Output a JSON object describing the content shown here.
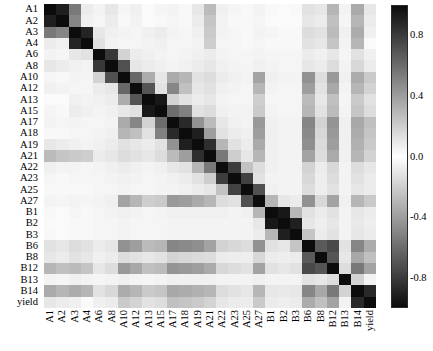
{
  "figure": {
    "type": "correlation-heatmap",
    "background": "#ffffff"
  },
  "colorbar": {
    "name": "correlation-colorbar",
    "orientation": "vertical",
    "vmin": -1.0,
    "vmax": 1.0,
    "colormap": "symmetric-gray (white at 0, black at |1|)",
    "ticks": [
      {
        "label": "0.8",
        "value": 0.8
      },
      {
        "label": "0.4",
        "value": 0.4
      },
      {
        "label": "0.0",
        "value": 0.0
      },
      {
        "label": "-0.4",
        "value": -0.4
      },
      {
        "label": "-0.8",
        "value": -0.8
      }
    ]
  },
  "chart_data": {
    "type": "heatmap",
    "title": "",
    "xlabel": "",
    "ylabel": "",
    "grid": false,
    "legend_position": "right",
    "colorbar_label": "",
    "vmin": -1.0,
    "vmax": 1.0,
    "categories": [
      "A1",
      "A2",
      "A3",
      "A4",
      "A6",
      "A8",
      "A10",
      "A12",
      "A13",
      "A15",
      "A17",
      "A18",
      "A19",
      "A21",
      "A22",
      "A23",
      "A25",
      "A27",
      "B1",
      "B2",
      "B3",
      "B6",
      "B8",
      "B12",
      "B13",
      "B14",
      "yield"
    ],
    "x_tick_labels": [
      "A1",
      "A2",
      "A3",
      "A4",
      "A6",
      "A8",
      "A10",
      "A12",
      "A13",
      "A15",
      "A17",
      "A18",
      "A19",
      "A21",
      "A22",
      "A23",
      "A25",
      "A27",
      "B1",
      "B2",
      "B3",
      "B6",
      "B8",
      "B12",
      "B13",
      "B14",
      "yield"
    ],
    "y_tick_labels": [
      "A1",
      "A2",
      "A3",
      "A4",
      "A6",
      "A8",
      "A10",
      "A12",
      "A13",
      "A15",
      "A17",
      "A18",
      "A19",
      "A21",
      "A22",
      "A23",
      "A25",
      "A27",
      "B1",
      "B2",
      "B3",
      "B6",
      "B8",
      "B12",
      "B13",
      "B14",
      "yield"
    ],
    "values": [
      [
        1.0,
        0.92,
        0.55,
        0.08,
        0.05,
        0.1,
        0.04,
        0.06,
        0.02,
        0.04,
        0.05,
        0.03,
        0.1,
        0.28,
        0.06,
        0.04,
        0.03,
        0.05,
        0.03,
        0.02,
        0.03,
        0.12,
        0.1,
        0.3,
        0.05,
        0.35,
        0.1
      ],
      [
        0.92,
        1.0,
        0.5,
        0.06,
        0.04,
        0.08,
        0.03,
        0.05,
        0.02,
        0.03,
        0.04,
        0.03,
        0.08,
        0.24,
        0.05,
        0.03,
        0.03,
        0.04,
        0.02,
        0.02,
        0.02,
        0.1,
        0.08,
        0.26,
        0.04,
        0.3,
        0.08
      ],
      [
        0.55,
        0.5,
        1.0,
        0.9,
        0.1,
        0.06,
        0.05,
        0.04,
        0.06,
        0.08,
        0.05,
        0.04,
        0.06,
        0.22,
        0.05,
        0.04,
        0.03,
        0.05,
        0.04,
        0.03,
        0.03,
        0.14,
        0.12,
        0.28,
        0.06,
        0.34,
        0.06
      ],
      [
        0.08,
        0.06,
        0.9,
        1.0,
        0.12,
        0.05,
        0.04,
        0.04,
        0.05,
        0.06,
        0.04,
        0.04,
        0.05,
        0.2,
        0.04,
        0.04,
        0.03,
        0.04,
        0.03,
        0.03,
        0.03,
        0.12,
        0.1,
        0.24,
        0.05,
        0.3,
        0.02
      ],
      [
        0.05,
        0.04,
        0.1,
        0.12,
        1.0,
        0.82,
        0.18,
        0.08,
        0.06,
        0.05,
        0.04,
        0.05,
        0.06,
        0.08,
        0.05,
        0.04,
        0.04,
        0.05,
        0.04,
        0.04,
        0.04,
        0.08,
        0.06,
        0.1,
        0.04,
        0.12,
        0.06
      ],
      [
        0.1,
        0.08,
        0.06,
        0.05,
        0.82,
        1.0,
        0.72,
        0.1,
        0.08,
        0.06,
        0.05,
        0.06,
        0.08,
        0.1,
        0.06,
        0.05,
        0.04,
        0.06,
        0.05,
        0.04,
        0.04,
        0.1,
        0.08,
        0.14,
        0.05,
        0.16,
        0.08
      ],
      [
        0.04,
        0.03,
        0.05,
        0.04,
        0.18,
        0.72,
        1.0,
        0.62,
        0.34,
        0.1,
        0.35,
        0.3,
        0.12,
        0.14,
        0.08,
        0.06,
        0.05,
        0.38,
        0.06,
        0.05,
        0.05,
        0.45,
        0.14,
        0.42,
        0.06,
        0.34,
        0.22
      ],
      [
        0.06,
        0.05,
        0.04,
        0.04,
        0.08,
        0.1,
        0.62,
        1.0,
        0.7,
        0.12,
        0.5,
        0.26,
        0.1,
        0.12,
        0.06,
        0.05,
        0.04,
        0.3,
        0.05,
        0.04,
        0.04,
        0.4,
        0.12,
        0.36,
        0.05,
        0.3,
        0.18
      ],
      [
        0.02,
        0.02,
        0.06,
        0.05,
        0.06,
        0.08,
        0.34,
        0.7,
        1.0,
        0.95,
        0.18,
        0.12,
        0.08,
        0.1,
        0.05,
        0.04,
        0.04,
        0.2,
        0.04,
        0.04,
        0.04,
        0.28,
        0.1,
        0.26,
        0.04,
        0.22,
        0.12
      ],
      [
        0.04,
        0.03,
        0.08,
        0.06,
        0.05,
        0.06,
        0.1,
        0.12,
        0.95,
        1.0,
        0.6,
        0.52,
        0.12,
        0.14,
        0.06,
        0.05,
        0.05,
        0.22,
        0.05,
        0.04,
        0.04,
        0.3,
        0.12,
        0.28,
        0.05,
        0.24,
        0.14
      ],
      [
        0.05,
        0.04,
        0.05,
        0.04,
        0.04,
        0.05,
        0.35,
        0.5,
        0.18,
        0.6,
        1.0,
        0.88,
        0.45,
        0.28,
        0.1,
        0.06,
        0.05,
        0.42,
        0.06,
        0.05,
        0.05,
        0.5,
        0.18,
        0.44,
        0.06,
        0.36,
        0.26
      ],
      [
        0.03,
        0.03,
        0.04,
        0.04,
        0.05,
        0.06,
        0.3,
        0.26,
        0.12,
        0.52,
        0.88,
        1.0,
        0.92,
        0.4,
        0.12,
        0.08,
        0.06,
        0.4,
        0.06,
        0.05,
        0.05,
        0.48,
        0.16,
        0.42,
        0.06,
        0.34,
        0.24
      ],
      [
        0.1,
        0.08,
        0.06,
        0.05,
        0.06,
        0.08,
        0.12,
        0.1,
        0.08,
        0.12,
        0.45,
        0.92,
        1.0,
        0.86,
        0.3,
        0.12,
        0.08,
        0.35,
        0.06,
        0.05,
        0.05,
        0.46,
        0.15,
        0.4,
        0.06,
        0.32,
        0.22
      ],
      [
        0.28,
        0.24,
        0.22,
        0.2,
        0.08,
        0.1,
        0.14,
        0.12,
        0.1,
        0.14,
        0.28,
        0.4,
        0.86,
        1.0,
        0.55,
        0.2,
        0.1,
        0.3,
        0.06,
        0.05,
        0.05,
        0.38,
        0.14,
        0.35,
        0.06,
        0.3,
        0.18
      ],
      [
        0.06,
        0.05,
        0.05,
        0.04,
        0.05,
        0.06,
        0.08,
        0.06,
        0.05,
        0.06,
        0.1,
        0.12,
        0.3,
        0.55,
        1.0,
        0.8,
        0.25,
        0.14,
        0.06,
        0.05,
        0.05,
        0.18,
        0.08,
        0.16,
        0.05,
        0.14,
        0.1
      ],
      [
        0.04,
        0.03,
        0.04,
        0.04,
        0.04,
        0.05,
        0.06,
        0.05,
        0.04,
        0.05,
        0.06,
        0.08,
        0.12,
        0.2,
        0.8,
        1.0,
        0.78,
        0.12,
        0.05,
        0.05,
        0.05,
        0.16,
        0.07,
        0.14,
        0.05,
        0.12,
        0.08
      ],
      [
        0.03,
        0.03,
        0.03,
        0.03,
        0.04,
        0.04,
        0.05,
        0.04,
        0.04,
        0.05,
        0.05,
        0.06,
        0.08,
        0.1,
        0.25,
        0.78,
        1.0,
        0.72,
        0.06,
        0.05,
        0.05,
        0.14,
        0.07,
        0.12,
        0.05,
        0.1,
        0.08
      ],
      [
        0.05,
        0.04,
        0.05,
        0.04,
        0.05,
        0.06,
        0.38,
        0.3,
        0.2,
        0.22,
        0.42,
        0.4,
        0.35,
        0.3,
        0.14,
        0.12,
        0.72,
        1.0,
        0.3,
        0.1,
        0.08,
        0.45,
        0.16,
        0.38,
        0.06,
        0.3,
        0.22
      ],
      [
        0.03,
        0.02,
        0.04,
        0.03,
        0.04,
        0.05,
        0.06,
        0.05,
        0.04,
        0.05,
        0.06,
        0.06,
        0.06,
        0.06,
        0.06,
        0.05,
        0.06,
        0.3,
        1.0,
        0.95,
        0.3,
        0.12,
        0.08,
        0.12,
        0.05,
        0.1,
        0.08
      ],
      [
        0.02,
        0.02,
        0.03,
        0.03,
        0.04,
        0.04,
        0.05,
        0.04,
        0.04,
        0.04,
        0.05,
        0.05,
        0.05,
        0.05,
        0.05,
        0.05,
        0.05,
        0.1,
        0.95,
        1.0,
        0.92,
        0.1,
        0.07,
        0.1,
        0.05,
        0.09,
        0.07
      ],
      [
        0.03,
        0.02,
        0.03,
        0.03,
        0.04,
        0.04,
        0.05,
        0.04,
        0.04,
        0.04,
        0.05,
        0.05,
        0.05,
        0.05,
        0.05,
        0.05,
        0.05,
        0.08,
        0.3,
        0.92,
        1.0,
        0.24,
        0.08,
        0.12,
        0.05,
        0.1,
        0.08
      ],
      [
        0.12,
        0.1,
        0.14,
        0.12,
        0.08,
        0.1,
        0.45,
        0.4,
        0.28,
        0.3,
        0.5,
        0.48,
        0.46,
        0.38,
        0.18,
        0.16,
        0.14,
        0.45,
        0.12,
        0.1,
        0.24,
        1.0,
        0.68,
        0.75,
        0.12,
        0.5,
        0.34
      ],
      [
        0.1,
        0.08,
        0.12,
        0.1,
        0.06,
        0.08,
        0.14,
        0.12,
        0.1,
        0.12,
        0.18,
        0.16,
        0.15,
        0.14,
        0.08,
        0.07,
        0.07,
        0.16,
        0.08,
        0.07,
        0.08,
        0.68,
        1.0,
        0.7,
        0.1,
        0.36,
        0.26
      ],
      [
        0.3,
        0.26,
        0.28,
        0.24,
        0.1,
        0.14,
        0.42,
        0.36,
        0.26,
        0.28,
        0.44,
        0.42,
        0.4,
        0.35,
        0.16,
        0.14,
        0.12,
        0.38,
        0.12,
        0.1,
        0.12,
        0.75,
        0.7,
        1.0,
        0.14,
        0.55,
        0.38
      ],
      [
        0.05,
        0.04,
        0.06,
        0.05,
        0.04,
        0.05,
        0.06,
        0.05,
        0.04,
        0.05,
        0.06,
        0.06,
        0.06,
        0.06,
        0.05,
        0.05,
        0.05,
        0.06,
        0.05,
        0.05,
        0.05,
        0.12,
        0.1,
        0.14,
        1.0,
        0.18,
        0.05
      ],
      [
        0.35,
        0.3,
        0.34,
        0.3,
        0.12,
        0.16,
        0.34,
        0.3,
        0.22,
        0.24,
        0.36,
        0.34,
        0.32,
        0.3,
        0.14,
        0.12,
        0.1,
        0.3,
        0.1,
        0.09,
        0.1,
        0.5,
        0.36,
        0.55,
        0.18,
        1.0,
        0.88
      ],
      [
        0.1,
        0.08,
        0.06,
        0.02,
        0.06,
        0.08,
        0.22,
        0.18,
        0.12,
        0.14,
        0.26,
        0.24,
        0.22,
        0.18,
        0.1,
        0.08,
        0.08,
        0.22,
        0.08,
        0.07,
        0.08,
        0.34,
        0.26,
        0.38,
        0.05,
        0.88,
        1.0
      ]
    ]
  }
}
